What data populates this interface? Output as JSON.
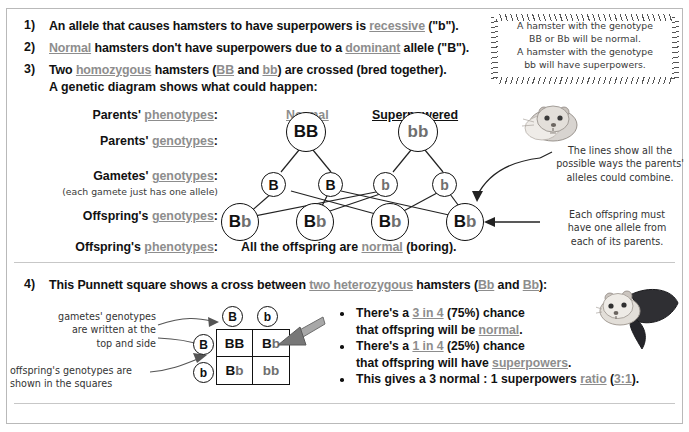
{
  "points": [
    {
      "num": "1)",
      "segments": [
        {
          "t": "An allele that causes hamsters to have superpowers is ",
          "s": "plain"
        },
        {
          "t": "recessive",
          "s": "gloss"
        },
        {
          "t": " (\"b\").",
          "s": "plain"
        }
      ]
    },
    {
      "num": "2)",
      "segments": [
        {
          "t": "Normal",
          "s": "gloss"
        },
        {
          "t": " hamsters don't have superpowers due to a ",
          "s": "plain"
        },
        {
          "t": "dominant",
          "s": "gloss"
        },
        {
          "t": " allele (\"B\").",
          "s": "plain"
        }
      ]
    },
    {
      "num": "3)",
      "segments": [
        {
          "t": "Two ",
          "s": "plain"
        },
        {
          "t": "homozygous",
          "s": "gloss"
        },
        {
          "t": " hamsters (",
          "s": "plain"
        },
        {
          "t": "BB",
          "s": "gloss"
        },
        {
          "t": " and ",
          "s": "plain"
        },
        {
          "t": "bb",
          "s": "gloss"
        },
        {
          "t": ") are crossed (bred together).",
          "s": "plain"
        }
      ]
    }
  ],
  "point3_line2": "A genetic diagram shows what could happen:",
  "point4": {
    "num": "4)",
    "segments": [
      {
        "t": "This Punnett square shows a cross between ",
        "s": "plain"
      },
      {
        "t": "two heterozygous",
        "s": "gloss"
      },
      {
        "t": " hamsters (",
        "s": "plain"
      },
      {
        "t": "Bb",
        "s": "gloss"
      },
      {
        "t": " and ",
        "s": "plain"
      },
      {
        "t": "Bb",
        "s": "gloss"
      },
      {
        "t": "):",
        "s": "plain"
      }
    ]
  },
  "sticky_note": {
    "lines": [
      "A hamster with the genotype",
      "BB or Bb will be normal.",
      "A hamster with the genotype",
      "bb will have superpowers."
    ]
  },
  "diagram": {
    "column_headings": [
      {
        "text": "Normal",
        "style": "gloss"
      },
      {
        "text": "Superpowered",
        "style": "black-underline"
      }
    ],
    "rows": [
      {
        "pre": "Parents' ",
        "gloss": "phenotypes",
        "post": ":"
      },
      {
        "pre": "Parents' ",
        "gloss": "genotypes",
        "post": ":"
      },
      {
        "pre": "Gametes' ",
        "gloss": "genotypes",
        "post": ":"
      },
      {
        "pre": "Offspring's ",
        "gloss": "genotypes",
        "post": ":"
      },
      {
        "pre": "Offspring's ",
        "gloss": "phenotypes",
        "post": ":"
      }
    ],
    "gamete_note": "(each gamete just has one allele)",
    "parents": [
      {
        "label_bold": "BB",
        "label_light": ""
      },
      {
        "label_bold": "",
        "label_light": "bb"
      }
    ],
    "gametes": [
      {
        "label_bold": "B",
        "label_light": ""
      },
      {
        "label_bold": "B",
        "label_light": ""
      },
      {
        "label_bold": "",
        "label_light": "b"
      },
      {
        "label_bold": "",
        "label_light": "b"
      }
    ],
    "offspring": [
      {
        "label_bold": "B",
        "label_light": "b"
      },
      {
        "label_bold": "B",
        "label_light": "b"
      },
      {
        "label_bold": "B",
        "label_light": "b"
      },
      {
        "label_bold": "B",
        "label_light": "b"
      }
    ],
    "conclusion": {
      "pre": "All the offspring are ",
      "gloss": "normal",
      "post": " (boring)."
    },
    "annotations": [
      {
        "id": "lines-note",
        "lines": [
          "The lines show all the",
          "possible ways the parents'",
          "alleles could combine."
        ]
      },
      {
        "id": "offspring-note",
        "lines": [
          "Each offspring must",
          "have one allele from",
          "each of its parents."
        ]
      }
    ]
  },
  "punnett": {
    "col_headers": [
      "B",
      "b"
    ],
    "row_headers": [
      "B",
      "b"
    ],
    "cells": [
      [
        {
          "bold": "BB",
          "light": ""
        },
        {
          "bold": "B",
          "light": "b"
        }
      ],
      [
        {
          "bold": "B",
          "light": "b"
        },
        {
          "bold": "",
          "light": "bb"
        }
      ]
    ],
    "note_top": [
      "gametes' genotypes",
      "are written at the",
      "top and side"
    ],
    "note_bottom": [
      "offspring's genotypes are",
      "shown in the squares"
    ]
  },
  "bullets": [
    {
      "lines": [
        [
          {
            "t": "There's a ",
            "s": "plain"
          },
          {
            "t": "3 in 4",
            "s": "gloss"
          },
          {
            "t": " (75%) chance",
            "s": "plain"
          }
        ],
        [
          {
            "t": "that offspring will be ",
            "s": "plain"
          },
          {
            "t": "normal",
            "s": "gloss"
          },
          {
            "t": ".",
            "s": "plain"
          }
        ]
      ]
    },
    {
      "lines": [
        [
          {
            "t": "There's a ",
            "s": "plain"
          },
          {
            "t": "1 in 4",
            "s": "gloss"
          },
          {
            "t": " (25%) chance",
            "s": "plain"
          }
        ],
        [
          {
            "t": "that offspring will have ",
            "s": "plain"
          },
          {
            "t": "superpowers",
            "s": "gloss"
          },
          {
            "t": ".",
            "s": "plain"
          }
        ]
      ]
    },
    {
      "lines": [
        [
          {
            "t": "This gives a 3 normal : 1 superpowers ",
            "s": "plain"
          },
          {
            "t": "ratio",
            "s": "gloss"
          },
          {
            "t": " (",
            "s": "plain"
          },
          {
            "t": "3:1",
            "s": "gloss"
          },
          {
            "t": ").",
            "s": "plain"
          }
        ]
      ]
    }
  ],
  "illustrations": [
    {
      "name": "normal-hamster",
      "description": "grey hamster"
    },
    {
      "name": "superhero-hamster",
      "description": "grey hamster with black cape"
    }
  ],
  "colors": {
    "text": "#111111",
    "glossary": "#8d8d8d",
    "hand": "#333333",
    "rule": "#c7c7c7",
    "arrow_3d": "#9a9a9a"
  }
}
